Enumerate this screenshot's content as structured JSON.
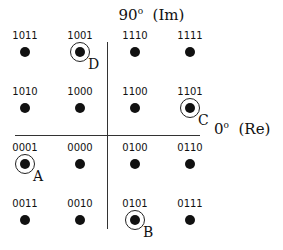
{
  "title": {
    "angle": "90",
    "deg": "o",
    "axis": "(Im)"
  },
  "real_axis": {
    "angle": "0",
    "deg": "o",
    "axis": "(Re)"
  },
  "points": [
    {
      "code": "1011",
      "x": 25,
      "y": 52,
      "marker": ""
    },
    {
      "code": "1001",
      "x": 80,
      "y": 52,
      "marker": "D"
    },
    {
      "code": "1110",
      "x": 135,
      "y": 52,
      "marker": ""
    },
    {
      "code": "1111",
      "x": 190,
      "y": 52,
      "marker": ""
    },
    {
      "code": "1010",
      "x": 25,
      "y": 108,
      "marker": ""
    },
    {
      "code": "1000",
      "x": 80,
      "y": 108,
      "marker": ""
    },
    {
      "code": "1100",
      "x": 135,
      "y": 108,
      "marker": ""
    },
    {
      "code": "1101",
      "x": 190,
      "y": 108,
      "marker": "C"
    },
    {
      "code": "0001",
      "x": 25,
      "y": 164,
      "marker": "A"
    },
    {
      "code": "0000",
      "x": 80,
      "y": 164,
      "marker": ""
    },
    {
      "code": "0100",
      "x": 135,
      "y": 164,
      "marker": ""
    },
    {
      "code": "0110",
      "x": 190,
      "y": 164,
      "marker": ""
    },
    {
      "code": "0011",
      "x": 25,
      "y": 220,
      "marker": ""
    },
    {
      "code": "0010",
      "x": 80,
      "y": 220,
      "marker": ""
    },
    {
      "code": "0101",
      "x": 135,
      "y": 220,
      "marker": "B"
    },
    {
      "code": "0111",
      "x": 190,
      "y": 220,
      "marker": ""
    }
  ]
}
